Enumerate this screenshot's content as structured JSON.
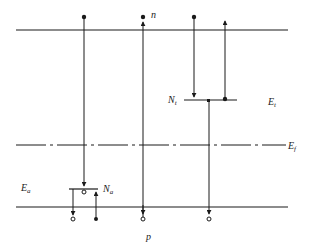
{
  "diagram": {
    "colors": {
      "ink": "#1a1a1a",
      "background": "#ffffff"
    },
    "labels": {
      "n": "n",
      "p": "p",
      "Nt": {
        "main": "N",
        "sub": "t"
      },
      "Et": {
        "main": "E",
        "sub": "t"
      },
      "Ef": {
        "main": "E",
        "sub": "f"
      },
      "Ea": {
        "main": "E",
        "sub": "a"
      },
      "Na": {
        "main": "N",
        "sub": "a"
      }
    },
    "levels": [
      {
        "name": "conduction-band-edge",
        "y": 30,
        "style": "solid"
      },
      {
        "name": "trap-level",
        "y": 100,
        "style": "solid"
      },
      {
        "name": "fermi-level",
        "y": 145,
        "style": "dash-dot"
      },
      {
        "name": "acceptor-level",
        "y": 189,
        "style": "solid"
      },
      {
        "name": "valence-band-edge",
        "y": 207,
        "style": "solid"
      }
    ]
  }
}
